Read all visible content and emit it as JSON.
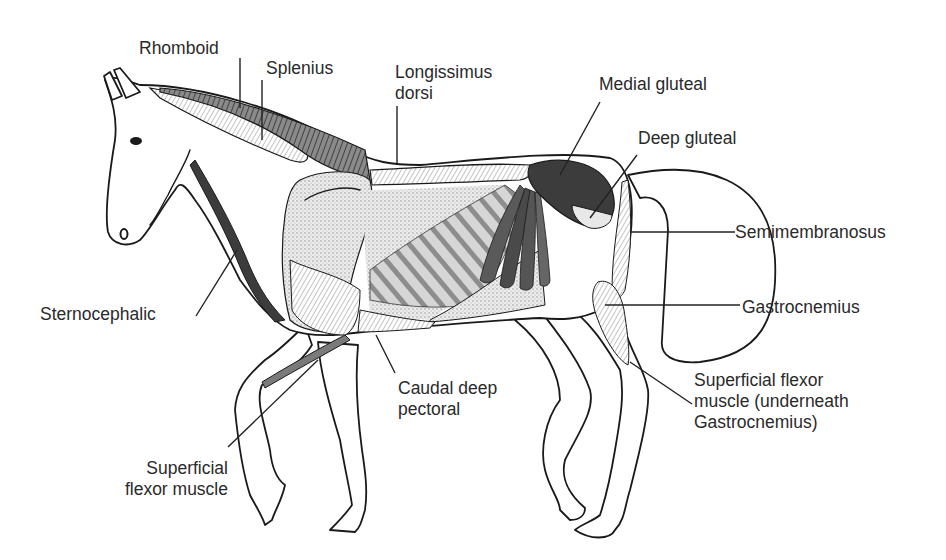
{
  "figure": {
    "colors": {
      "background": "#ffffff",
      "outline": "#1a1a1a",
      "dark_muscle": "#3c3c3c",
      "mid_muscle": "#7a7a7a",
      "stipple": "#c9c9c9",
      "label_text": "#2a2a2a"
    },
    "labels": [
      {
        "id": "rhomboid",
        "lines": [
          "Rhomboid"
        ]
      },
      {
        "id": "splenius",
        "lines": [
          "Splenius"
        ]
      },
      {
        "id": "longissimus",
        "lines": [
          "Longissimus",
          "dorsi"
        ]
      },
      {
        "id": "medial_gluteal",
        "lines": [
          "Medial gluteal"
        ]
      },
      {
        "id": "deep_gluteal",
        "lines": [
          "Deep gluteal"
        ]
      },
      {
        "id": "semimembranosus",
        "lines": [
          "Semimembranosus"
        ]
      },
      {
        "id": "gastrocnemius",
        "lines": [
          "Gastrocnemius"
        ]
      },
      {
        "id": "sup_flexor_hind",
        "lines": [
          "Superficial flexor",
          "muscle (underneath",
          "Gastrocnemius)"
        ]
      },
      {
        "id": "sternocephalic",
        "lines": [
          "Sternocephalic"
        ]
      },
      {
        "id": "caudal_deep_pectoral",
        "lines": [
          "Caudal deep",
          "pectoral"
        ]
      },
      {
        "id": "sup_flexor_fore",
        "lines": [
          "Superficial",
          "flexor muscle"
        ]
      }
    ]
  }
}
